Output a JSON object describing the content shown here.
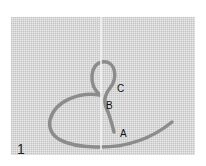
{
  "figure": {
    "step_number": "1",
    "labels": {
      "a": "A",
      "b": "B",
      "c": "C"
    },
    "colors": {
      "fabric": "#d9d9d9",
      "thread": "#8a8a8a",
      "needle": "#f2f2f2",
      "text": "#111111"
    }
  }
}
